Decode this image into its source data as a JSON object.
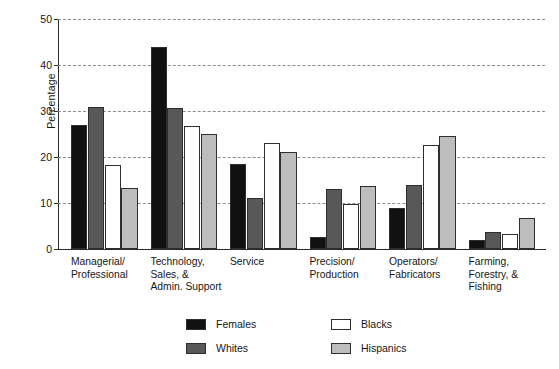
{
  "chart_data": {
    "type": "bar",
    "title": "",
    "subtitle": "",
    "xlabel": "",
    "ylabel": "Percentage",
    "ylim": [
      0,
      50
    ],
    "yticks": [
      0,
      10,
      20,
      30,
      40,
      50
    ],
    "ytick_labels": [
      "0",
      "10",
      "20",
      "30",
      "40",
      "50"
    ],
    "grid": "horizontal dashed gridlines at every y tick",
    "legend_position": "bottom-center, two columns",
    "categories": [
      "Managerial/\nProfessional",
      "Technology,\nSales, &\nAdmin. Support",
      "Service",
      "Precision/\nProduction",
      "Operators/\nFabricators",
      "Farming,\nForestry, &\nFishing"
    ],
    "series": [
      {
        "name": "Females",
        "color": "#111111",
        "values": [
          27.0,
          44.0,
          18.4,
          2.6,
          9.0,
          2.0
        ]
      },
      {
        "name": "Whites",
        "color": "#585858",
        "values": [
          30.8,
          30.6,
          11.0,
          13.0,
          14.0,
          3.8
        ]
      },
      {
        "name": "Blacks",
        "color": "#ffffff",
        "values": [
          18.2,
          26.8,
          23.0,
          9.8,
          22.6,
          3.2
        ]
      },
      {
        "name": "Hispanics",
        "color": "#bdbdbd",
        "values": [
          13.3,
          25.0,
          21.0,
          13.7,
          24.5,
          6.7
        ]
      }
    ]
  },
  "legend": {
    "items": [
      {
        "label": "Females",
        "swatch": "black-swatch"
      },
      {
        "label": "Whites",
        "swatch": "dark-gray-swatch"
      },
      {
        "label": "Blacks",
        "swatch": "white-swatch"
      },
      {
        "label": "Hispanics",
        "swatch": "light-gray-swatch"
      }
    ]
  },
  "colors": {
    "females": "#111111",
    "whites": "#585858",
    "blacks": "#ffffff",
    "hispanics": "#bdbdbd",
    "axis": "#2b2b2b",
    "grid": "#8c8c8c",
    "background": "#ffffff"
  }
}
